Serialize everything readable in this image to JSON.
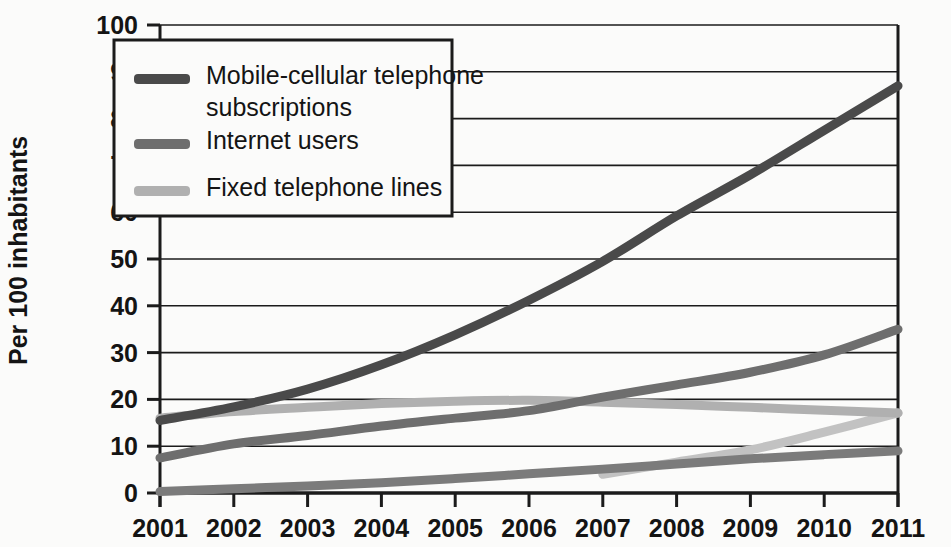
{
  "chart_data": {
    "type": "line",
    "title": "",
    "subtitle": "",
    "xlabel": "",
    "ylabel": "Per 100 inhabitants",
    "x": [
      2001,
      2002,
      2003,
      2004,
      2005,
      2006,
      2007,
      2008,
      2009,
      2010,
      2011
    ],
    "xticklabels": [
      "2001",
      "2002",
      "2003",
      "2004",
      "2005",
      "2006",
      "2007",
      "2008",
      "2009",
      "2010",
      "2011"
    ],
    "yticklabels": [
      "0",
      "10",
      "20",
      "30",
      "40",
      "50",
      "60",
      "70",
      "80",
      "90",
      "100"
    ],
    "yticks": [
      0,
      10,
      20,
      30,
      40,
      50,
      60,
      70,
      80,
      90,
      100
    ],
    "ylim": [
      0,
      100
    ],
    "xlim": [
      2001,
      2011
    ],
    "grid": "horizontal",
    "legend_position": "top-left-inside",
    "series": [
      {
        "name": "Mobile-cellular telephone subscriptions",
        "color": "#4a4a4a",
        "legend": true,
        "values": [
          15.5,
          18.4,
          22.2,
          27.4,
          33.8,
          41.2,
          49.5,
          59.2,
          68.0,
          77.5,
          87.0
        ]
      },
      {
        "name": "Internet users",
        "color": "#6e6e6e",
        "legend": true,
        "values": [
          7.5,
          10.5,
          12.3,
          14.3,
          16.0,
          17.6,
          20.5,
          23.1,
          25.8,
          29.5,
          35.0
        ]
      },
      {
        "name": "Fixed telephone lines",
        "color": "#b0b0b0",
        "legend": true,
        "values": [
          16.0,
          17.4,
          18.3,
          19.1,
          19.6,
          19.8,
          19.4,
          18.9,
          18.3,
          17.7,
          17.1
        ]
      },
      {
        "name": "unlabelled-lower-series",
        "color": "#7b7b7b",
        "legend": false,
        "values": [
          0.3,
          0.9,
          1.5,
          2.2,
          3.1,
          4.1,
          5.1,
          6.2,
          7.3,
          8.2,
          9.0
        ]
      },
      {
        "name": "unlabelled-light-series",
        "color": "#c2c2c2",
        "legend": false,
        "values": [
          null,
          null,
          null,
          null,
          null,
          null,
          4.0,
          6.6,
          9.2,
          13.0,
          17.1
        ]
      }
    ],
    "legend_entries": [
      {
        "label_line1": "Mobile-cellular telephone",
        "label_line2": "subscriptions",
        "color": "#4a4a4a"
      },
      {
        "label_line1": "Internet users",
        "label_line2": "",
        "color": "#6e6e6e"
      },
      {
        "label_line1": "Fixed telephone lines",
        "label_line2": "",
        "color": "#b0b0b0"
      }
    ]
  },
  "axis": {
    "y_title": "Per 100 inhabitants"
  },
  "ticks": {
    "y": [
      "100",
      "90",
      "80",
      "70",
      "60",
      "50",
      "40",
      "30",
      "20",
      "10",
      "0"
    ],
    "x": [
      "2001",
      "2002",
      "2003",
      "2004",
      "2005",
      "2006",
      "2007",
      "2008",
      "2009",
      "2010",
      "2011"
    ]
  },
  "legend": {
    "item0_line1": "Mobile-cellular telephone",
    "item0_line2": "subscriptions",
    "item1_line1": "Internet users",
    "item2_line1": "Fixed telephone lines"
  },
  "colors": {
    "mobile": "#4a4a4a",
    "internet": "#6e6e6e",
    "fixed": "#b0b0b0",
    "lower": "#7b7b7b",
    "light": "#c2c2c2",
    "grid": "#1b1b1b",
    "background": "#fbfbfa"
  }
}
